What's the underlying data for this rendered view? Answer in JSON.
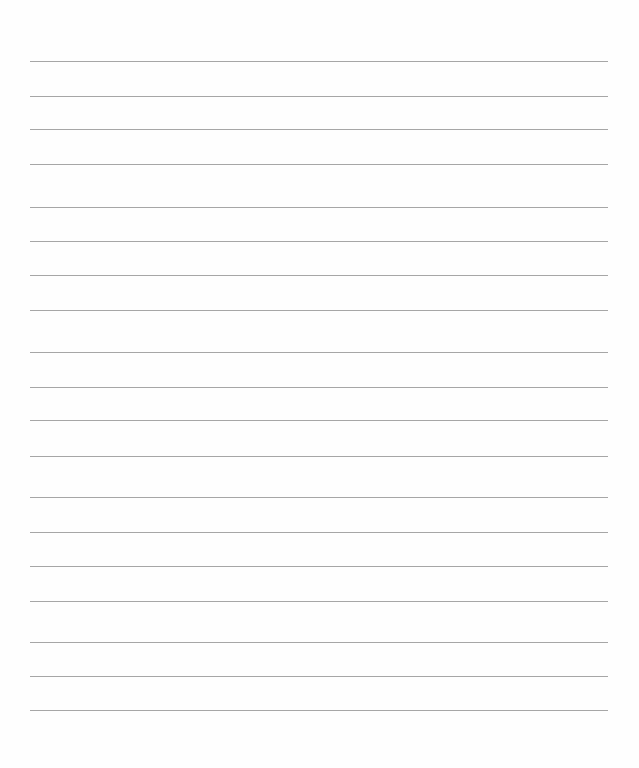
{
  "page": {
    "type": "lined-paper",
    "line_color": "#a6a6a6",
    "line_left": 30,
    "line_right": 608,
    "lines_y": [
      61,
      96,
      129,
      164,
      207,
      241,
      275,
      310,
      352,
      387,
      420,
      456,
      497,
      532,
      566,
      601,
      642,
      676,
      710
    ]
  }
}
